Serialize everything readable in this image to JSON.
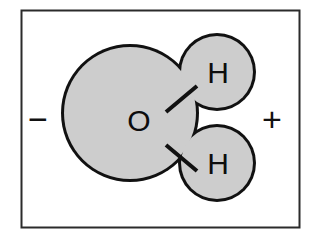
{
  "figure": {
    "background_color": "#ffffff",
    "border_color": "#2b2b2b",
    "molecule_fill": "#cdcdcd",
    "outline_color": "#111111",
    "label_color": "#0d0d0d"
  },
  "atoms": {
    "oxygen": {
      "symbol": "O",
      "cx": 130,
      "cy": 113,
      "r": 69
    },
    "hydrogen_top": {
      "symbol": "H",
      "cx": 217,
      "cy": 72,
      "r": 39
    },
    "hydrogen_bottom": {
      "symbol": "H",
      "cx": 217,
      "cy": 163,
      "r": 39
    }
  },
  "bonds": [
    {
      "name": "o-h-top",
      "x1": 166,
      "y1": 112,
      "x2": 197,
      "y2": 86
    },
    {
      "name": "o-h-bottom",
      "x1": 166,
      "y1": 145,
      "x2": 197,
      "y2": 171
    }
  ],
  "charges": {
    "negative": {
      "symbol": "−",
      "x": 38,
      "y": 119
    },
    "positive": {
      "symbol": "+",
      "x": 272,
      "y": 119
    }
  },
  "frame": {
    "x": 21,
    "y": 10,
    "width": 279,
    "height": 218
  }
}
